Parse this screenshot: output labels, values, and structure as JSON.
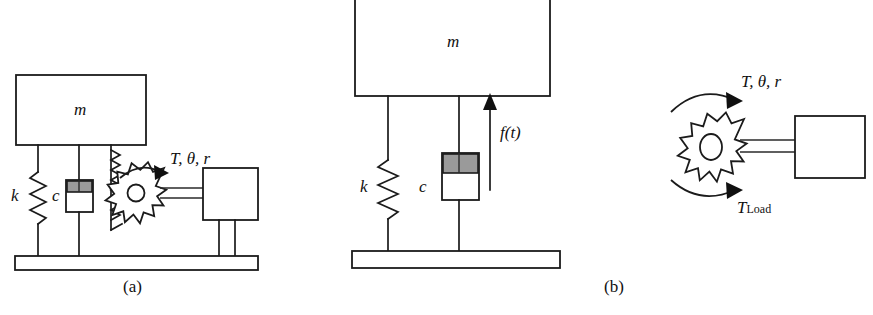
{
  "figure": {
    "background_color": "#ffffff",
    "line_color": "#1b1b1b",
    "piston_fill_color": "#9a9a9a"
  },
  "panel_a": {
    "caption": "(a)",
    "mass_label": "m",
    "spring_label": "k",
    "damper_label": "c",
    "torque_label": "T, θ, r"
  },
  "panel_b_center": {
    "mass_label": "m",
    "spring_label": "k",
    "damper_label": "c",
    "force_label": "f(t)"
  },
  "panel_b_right": {
    "caption": "(b)",
    "torque_label": "T, θ, r",
    "load_torque_symbol": "T",
    "load_torque_subscript": "Load"
  }
}
